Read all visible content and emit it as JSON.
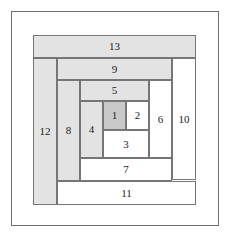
{
  "figure": {
    "width": 231,
    "height": 238,
    "background_color": "#ffffff",
    "frame_color": "#6e6e6e",
    "patch_outline_color": "#767676"
  },
  "colors": {
    "center_fill": "#c9c9c9",
    "shaded_fill": "#e3e3e3",
    "plain_fill": "#ffffff",
    "label_color": "#1d1d1d"
  },
  "patches": [
    {
      "label": "1",
      "fill": "#c9c9c9",
      "shade": "center",
      "x": 103,
      "y": 101,
      "w": 23,
      "h": 29
    },
    {
      "label": "2",
      "fill": "#ffffff",
      "shade": "plain",
      "x": 126,
      "y": 101,
      "w": 23,
      "h": 29
    },
    {
      "label": "3",
      "fill": "#ffffff",
      "shade": "plain",
      "x": 103,
      "y": 130,
      "w": 46,
      "h": 28
    },
    {
      "label": "4",
      "fill": "#e3e3e3",
      "shade": "shaded",
      "x": 80,
      "y": 101,
      "w": 23,
      "h": 57
    },
    {
      "label": "5",
      "fill": "#e3e3e3",
      "shade": "shaded",
      "x": 80,
      "y": 80,
      "w": 69,
      "h": 21
    },
    {
      "label": "6",
      "fill": "#ffffff",
      "shade": "plain",
      "x": 149,
      "y": 80,
      "w": 23,
      "h": 78
    },
    {
      "label": "7",
      "fill": "#ffffff",
      "shade": "plain",
      "x": 80,
      "y": 158,
      "w": 92,
      "h": 23
    },
    {
      "label": "8",
      "fill": "#e3e3e3",
      "shade": "shaded",
      "x": 57,
      "y": 80,
      "w": 23,
      "h": 101
    },
    {
      "label": "9",
      "fill": "#e3e3e3",
      "shade": "shaded",
      "x": 57,
      "y": 58,
      "w": 115,
      "h": 22
    },
    {
      "label": "10",
      "fill": "#ffffff",
      "shade": "plain",
      "x": 172,
      "y": 58,
      "w": 24,
      "h": 122
    },
    {
      "label": "11",
      "fill": "#ffffff",
      "shade": "plain",
      "x": 57,
      "y": 181,
      "w": 139,
      "h": 24
    },
    {
      "label": "12",
      "fill": "#e3e3e3",
      "shade": "shaded",
      "x": 33,
      "y": 58,
      "w": 24,
      "h": 147
    },
    {
      "label": "13",
      "fill": "#e3e3e3",
      "shade": "shaded",
      "x": 33,
      "y": 35,
      "w": 163,
      "h": 23
    }
  ]
}
